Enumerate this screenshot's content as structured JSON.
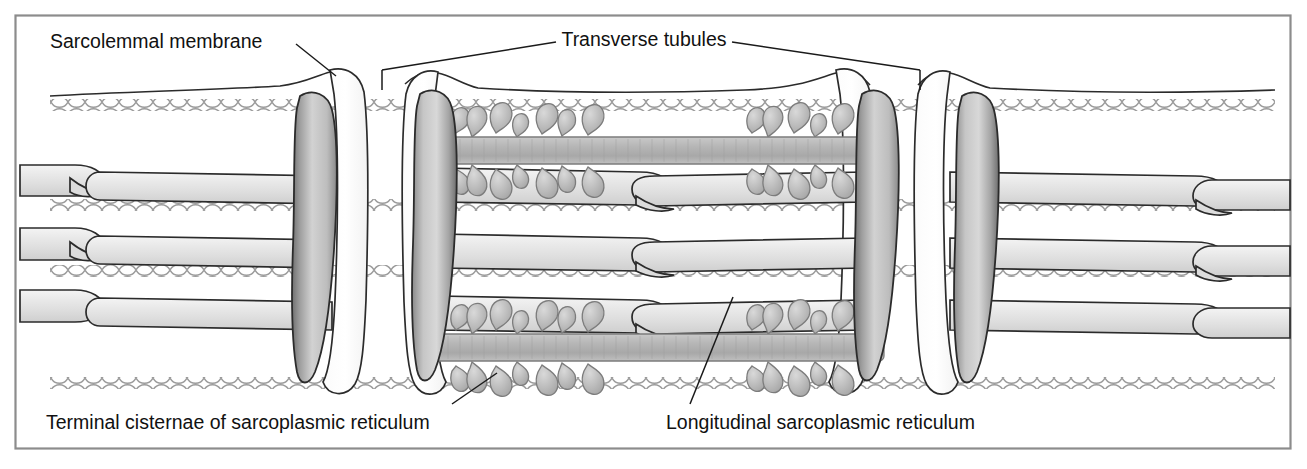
{
  "figure": {
    "frame_color": "#808080",
    "background": "#ffffff",
    "line_color": "#1a1a1a",
    "organelle_fill_light": "#e6e6e6",
    "organelle_fill_mid": "#c9c9c9",
    "organelle_fill_dark": "#9a9a9a",
    "filament_color": "#9b9b9b",
    "label_color": "#111111"
  },
  "labels": {
    "sarcolemmal_membrane": "Sarcolemmal membrane",
    "transverse_tubules": "Transverse tubules",
    "terminal_cisternae": "Terminal cisternae of sarcoplasmic reticulum",
    "longitudinal_sr": "Longitudinal sarcoplasmic reticulum"
  },
  "structures": {
    "sarcolemma": "outer cell membrane sheet running across the top of the fiber",
    "t_tubule_pairs": 2,
    "terminal_cisternae_count": 4,
    "myofibril_rows": 3,
    "actin_filament_rows": 4,
    "myosin_thick_filament": "central striated rod decorated with cross-bridge heads"
  }
}
